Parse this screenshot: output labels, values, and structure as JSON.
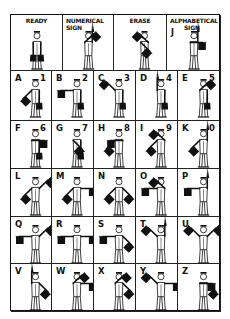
{
  "colors": {
    "ink": "#111111",
    "background": "#ffffff"
  },
  "header_row": [
    {
      "id": "ready",
      "label_line1": "READY",
      "label_line2": "",
      "prefix": "",
      "left": 0,
      "width": 52,
      "r": "down",
      "l": "down"
    },
    {
      "id": "numerical",
      "label_line1": "NUMERICAL",
      "label_line2": "SIGN",
      "prefix": "",
      "left": 52,
      "width": 51,
      "r": "up",
      "l": "upright"
    },
    {
      "id": "erase",
      "label_line1": "ERASE",
      "label_line2": "",
      "prefix": "",
      "left": 103,
      "width": 53,
      "r": "upleft",
      "l": "downright"
    },
    {
      "id": "alphabetical",
      "label_line1": "ALPHABETICAL",
      "label_line2": "SIGN",
      "prefix": "J",
      "left": 156,
      "width": 54,
      "r": "up",
      "l": "right"
    }
  ],
  "rows": [
    [
      {
        "letter": "A",
        "number": "1",
        "r": "down",
        "l": "downleft"
      },
      {
        "letter": "B",
        "number": "2",
        "r": "down",
        "l": "left"
      },
      {
        "letter": "C",
        "number": "3",
        "r": "down",
        "l": "upleft"
      },
      {
        "letter": "D",
        "number": "4",
        "r": "down",
        "l": "up"
      },
      {
        "letter": "E",
        "number": "5",
        "r": "down",
        "l": "upright"
      }
    ],
    [
      {
        "letter": "F",
        "number": "6",
        "r": "down",
        "l": "right"
      },
      {
        "letter": "G",
        "number": "7",
        "r": "down",
        "l": "downright"
      },
      {
        "letter": "H",
        "number": "8",
        "r": "left",
        "l": "downleft"
      },
      {
        "letter": "I",
        "number": "9",
        "r": "upleft",
        "l": "downleft"
      },
      {
        "letter": "K",
        "number": "0",
        "r": "up",
        "l": "downleft"
      }
    ],
    [
      {
        "letter": "L",
        "number": "",
        "r": "upright",
        "l": "downleft"
      },
      {
        "letter": "M",
        "number": "",
        "r": "right",
        "l": "downleft"
      },
      {
        "letter": "N",
        "number": "",
        "r": "downright",
        "l": "downleft"
      },
      {
        "letter": "O",
        "number": "",
        "r": "upleft",
        "l": "left"
      },
      {
        "letter": "P",
        "number": "",
        "r": "up",
        "l": "left"
      }
    ],
    [
      {
        "letter": "Q",
        "number": "",
        "r": "upright",
        "l": "left"
      },
      {
        "letter": "R",
        "number": "",
        "r": "right",
        "l": "left"
      },
      {
        "letter": "S",
        "number": "",
        "r": "downright",
        "l": "left"
      },
      {
        "letter": "T",
        "number": "",
        "r": "up",
        "l": "upleft"
      },
      {
        "letter": "U",
        "number": "",
        "r": "upright",
        "l": "upleft"
      }
    ],
    [
      {
        "letter": "V",
        "number": "",
        "r": "downright",
        "l": "up"
      },
      {
        "letter": "W",
        "number": "",
        "r": "right",
        "l": "upright"
      },
      {
        "letter": "X",
        "number": "",
        "r": "downright",
        "l": "upright"
      },
      {
        "letter": "Y",
        "number": "",
        "r": "right",
        "l": "upleft"
      },
      {
        "letter": "Z",
        "number": "",
        "r": "downright",
        "l": "right"
      }
    ]
  ],
  "layout": {
    "header_height": 56,
    "row_tops": [
      56,
      106,
      154,
      202,
      249
    ],
    "row_heights": [
      50,
      48,
      48,
      47,
      48
    ],
    "col_lefts": [
      0,
      41,
      83,
      125,
      167
    ],
    "col_widths": [
      41,
      42,
      42,
      42,
      43
    ]
  }
}
